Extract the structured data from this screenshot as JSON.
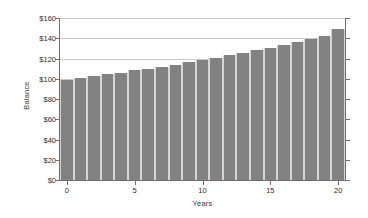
{
  "chart_data": {
    "type": "bar",
    "title": "",
    "subtitle": "",
    "xlabel": "Years",
    "ylabel": "Balance",
    "categories": [
      0,
      1,
      2,
      3,
      4,
      5,
      6,
      7,
      8,
      9,
      10,
      11,
      12,
      13,
      14,
      15,
      16,
      17,
      18,
      19,
      20
    ],
    "values": [
      99,
      101,
      103,
      105,
      106,
      109,
      110,
      112,
      114,
      117,
      119,
      121,
      123,
      125,
      128,
      130,
      133,
      136,
      139,
      142,
      149
    ],
    "series": [
      {
        "name": "Balance",
        "values": [
          99,
          101,
          103,
          105,
          106,
          109,
          110,
          112,
          114,
          117,
          119,
          121,
          123,
          125,
          128,
          130,
          133,
          136,
          139,
          142,
          149
        ]
      }
    ],
    "xlim": [
      -0.5,
      20.5
    ],
    "ylim": [
      0,
      160
    ],
    "x_ticks": [
      0,
      5,
      10,
      15,
      20
    ],
    "x_tick_labels": [
      "0",
      "5",
      "10",
      "15",
      "20"
    ],
    "y_ticks": [
      0,
      20,
      40,
      60,
      80,
      100,
      120,
      140,
      160
    ],
    "y_tick_labels": [
      "$0",
      "$20",
      "$40",
      "$60",
      "$80",
      "$100",
      "$120",
      "$140",
      "$160"
    ],
    "grid": true,
    "grid_axis": "y",
    "legend": false,
    "legend_position": "none",
    "bar_color": "#828282",
    "bar_edge_color": "#d6d6d6",
    "gridline_color": "#c9c9c9",
    "axis_color": "#6e6e6e",
    "background_color": "#ffffff",
    "annotations": []
  }
}
